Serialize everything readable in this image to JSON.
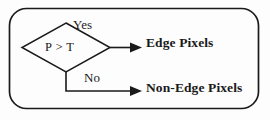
{
  "diagram": {
    "type": "flowchart-decision",
    "container": {
      "shape": "rounded-rectangle",
      "stroke_color": "#1a1a1a",
      "fill_color": "#fdfdfd"
    },
    "decision": {
      "shape": "diamond",
      "condition": "P > T",
      "stroke_color": "#1a1a1a"
    },
    "branches": [
      {
        "label": "Yes",
        "target": "Edge Pixels",
        "direction": "right"
      },
      {
        "label": "No",
        "target": "Non-Edge Pixels",
        "direction": "down-then-right"
      }
    ],
    "outputs": {
      "yes_output": "Edge Pixels",
      "no_output": "Non-Edge Pixels"
    },
    "colors": {
      "line": "#1a1a1a",
      "text": "#1a1a1a",
      "background": "#fdfdfd"
    }
  }
}
